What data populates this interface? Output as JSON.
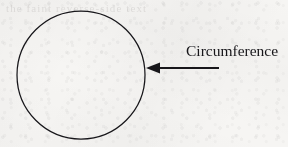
{
  "figure": {
    "background_color": "#f6f5f3",
    "ink_color": "#17161a",
    "bleed_through_text": "the faint reverse-side text"
  },
  "shapes": {
    "circle": {
      "name": "circle",
      "center_x": 81,
      "center_y": 75,
      "radius": 64,
      "stroke_width": 1.25,
      "stroke_color": "#17161a",
      "fill": "none"
    },
    "arrow": {
      "name": "leader-arrow",
      "direction": "left",
      "tail_x": 219,
      "tip_x": 146,
      "y": 68,
      "line_width": 2.1,
      "head_length": 14,
      "head_half_height": 5.5,
      "color": "#17161a"
    }
  },
  "labels": {
    "circumference": "Circumference"
  }
}
